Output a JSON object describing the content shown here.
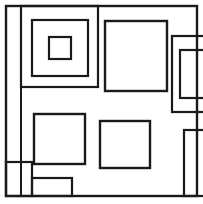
{
  "figure": {
    "canvas": {
      "width": 203,
      "height": 204,
      "background_color": "#ffffff"
    },
    "style": {
      "stroke_color": "#1a1a1a",
      "fill": "none",
      "default_stroke_width": 2.2
    },
    "shapes": [
      {
        "name": "outer-frame",
        "role": "outer border square",
        "x": 6,
        "y": 6,
        "width": 191,
        "height": 190,
        "stroke_width": 2.4
      },
      {
        "name": "left-column-divider",
        "role": "vertical divider line from top border to bottom border",
        "x1": 21,
        "y1": 7,
        "x2": 21,
        "y2": 195,
        "stroke_width": 2.0
      },
      {
        "name": "nested-square-outer",
        "role": "largest of three concentric squares, top edge merged with frame top",
        "x": 21,
        "y": 6,
        "width": 77,
        "height": 81,
        "stroke_width": 2.2
      },
      {
        "name": "nested-square-middle",
        "role": "middle concentric square",
        "x": 32,
        "y": 20,
        "width": 56,
        "height": 56,
        "stroke_width": 2.2
      },
      {
        "name": "nested-square-inner",
        "role": "innermost small concentric square",
        "x": 49,
        "y": 37,
        "width": 22,
        "height": 22,
        "stroke_width": 2.2
      },
      {
        "name": "upper-right-large-square",
        "role": "large square in upper middle-right area",
        "x": 105,
        "y": 21,
        "width": 62,
        "height": 70,
        "stroke_width": 2.4
      },
      {
        "name": "right-tall-rect-outer",
        "role": "tall rectangle at right edge, clipped by frame right side",
        "x": 172,
        "y": 36,
        "width": 33,
        "height": 76,
        "stroke_width": 2.2
      },
      {
        "name": "right-tall-rect-inner",
        "role": "narrower tall rectangle nested inside the right tall rectangle",
        "x": 180,
        "y": 50,
        "width": 28,
        "height": 48,
        "stroke_width": 2.2
      },
      {
        "name": "lower-left-square",
        "role": "square in lower-left quadrant",
        "x": 34,
        "y": 114,
        "width": 51,
        "height": 50,
        "stroke_width": 2.4
      },
      {
        "name": "lower-middle-square",
        "role": "square in lower-middle area",
        "x": 100,
        "y": 121,
        "width": 50,
        "height": 47,
        "stroke_width": 2.4
      },
      {
        "name": "lower-right-tall-rect",
        "role": "tall narrow rectangle at lower right, clipped by frame right edge",
        "x": 184,
        "y": 130,
        "width": 24,
        "height": 66,
        "stroke_width": 2.2
      },
      {
        "name": "bottom-left-small-rect",
        "role": "small rectangle at bottom-left corner, shares frame left and bottom edges",
        "x": 6,
        "y": 162,
        "width": 26,
        "height": 34,
        "stroke_width": 2.2
      },
      {
        "name": "bottom-wide-small-rect",
        "role": "short wide rectangle along bottom border next to the corner rectangle",
        "x": 32,
        "y": 178,
        "width": 40,
        "height": 18,
        "stroke_width": 2.2
      }
    ]
  }
}
